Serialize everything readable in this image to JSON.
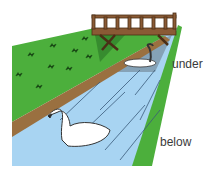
{
  "illustration": {
    "subject": "river with bridge and swans",
    "colors": {
      "grass": "#4caf3c",
      "grass_dark": "#2f7d2a",
      "water": "#a8d4f2",
      "water_shadow": "#7c95a8",
      "bank": "#9a7040",
      "bridge": "#8a5a35",
      "swan": "#ffffff"
    }
  },
  "labels": {
    "under": "under",
    "below": "below"
  }
}
